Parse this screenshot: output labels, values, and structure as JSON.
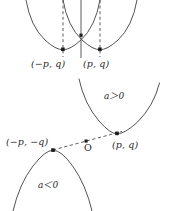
{
  "figure": {
    "stroke_color": "#4a4a4a",
    "dash_color": "#4a4a4a",
    "point_color": "#1a1a1a",
    "background": "#ffffff",
    "upper_panel": {
      "description": "Two upward parabolas intersecting on the vertical axis, vertices marked with dashed vertical drop lines",
      "axis": "vertical-line",
      "vertex_left_label": "(−p, q)",
      "vertex_right_label": "(p, q)",
      "points": [
        {
          "name": "vertex-left",
          "label": "(−p, q)",
          "x": 63,
          "y": 49
        },
        {
          "name": "vertex-right",
          "label": "(p, q)",
          "x": 100,
          "y": 49
        },
        {
          "name": "intersection",
          "label": "",
          "x": 81,
          "y": 35
        }
      ]
    },
    "lower_panel": {
      "description": "An upward parabola (a>0) and a downward parabola (a<0) tangent to a common dashed secant line through the origin",
      "a_positive_label": "a＞0",
      "a_negative_label": "a＜0",
      "origin_label": "O",
      "vertex_left_label": "(−p, −q)",
      "vertex_right_label": "(p, q)",
      "points": [
        {
          "name": "vertex-lower-left",
          "label": "(−p, −q)",
          "x": 53,
          "y": 150
        },
        {
          "name": "origin",
          "label": "O",
          "x": 86,
          "y": 141
        },
        {
          "name": "vertex-lower-right",
          "label": "(p, q)",
          "x": 117,
          "y": 133
        }
      ]
    }
  },
  "labels": {
    "top_left_vertex": "(−p, q)",
    "top_right_vertex": "(p, q)",
    "a_positive": "a＞0",
    "bottom_left_vertex": "(−p, −q)",
    "bottom_right_vertex": "(p, q)",
    "origin": "O",
    "a_negative": "a＜0"
  }
}
